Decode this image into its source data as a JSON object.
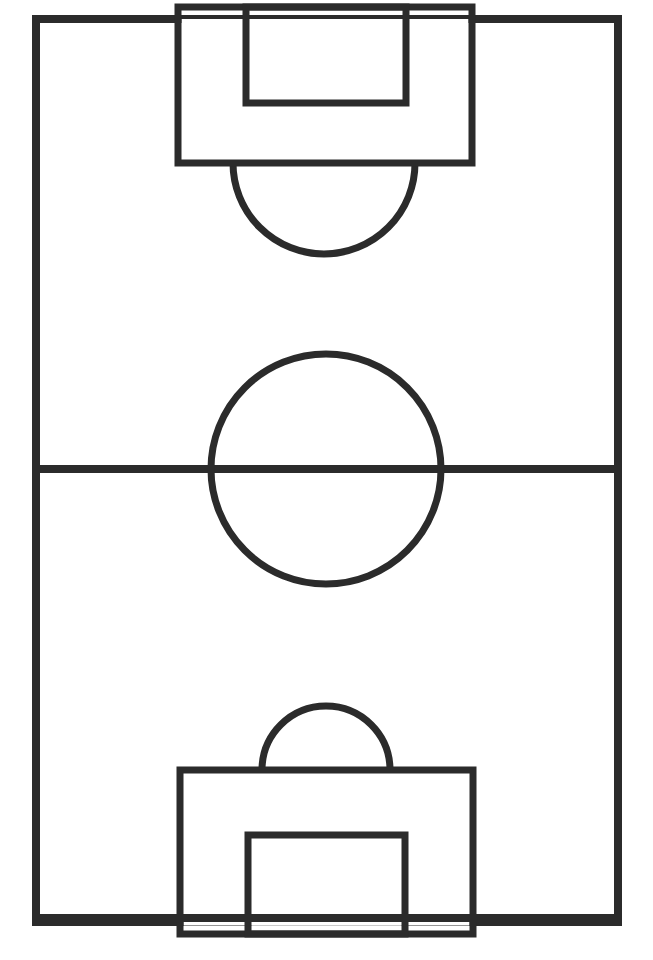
{
  "figure": {
    "orientation": "vertical",
    "canvas_width": 653,
    "canvas_height": 960,
    "background_color": "#fafafa"
  },
  "style": {
    "line_color": "#2b2b2b",
    "surface_color": "#ffffff",
    "boundary_stroke_width": 8,
    "halfway_stroke_width": 8,
    "box_stroke_width": 7,
    "arc_stroke_width": 7,
    "circle_stroke_width": 7
  },
  "chart_data": {
    "type": "diagram",
    "xlabel": "",
    "ylabel": "",
    "xlim": [
      0,
      653
    ],
    "ylim": [
      0,
      960
    ],
    "grid": false,
    "legend": "none",
    "elements": [
      {
        "name": "touchline-boundary",
        "shape": "rectangle",
        "x": 36,
        "y": 19,
        "width": 582,
        "height": 903,
        "stroke_width": 8
      },
      {
        "name": "halfway-line",
        "shape": "line",
        "x1": 36,
        "y1": 469,
        "x2": 618,
        "y2": 469,
        "stroke_width": 8
      },
      {
        "name": "center-circle",
        "shape": "circle",
        "cx": 326,
        "cy": 469,
        "r": 115,
        "stroke_width": 7
      },
      {
        "name": "top-penalty-area",
        "shape": "rectangle",
        "x": 178,
        "y": 19,
        "width": 294,
        "height": 144,
        "stroke_width": 7
      },
      {
        "name": "top-goal-area",
        "shape": "rectangle",
        "x": 246,
        "y": 19,
        "width": 160,
        "height": 84,
        "stroke_width": 7
      },
      {
        "name": "top-penalty-arc",
        "shape": "arc",
        "cx": 324,
        "cy": 163,
        "r": 91,
        "start_angle_deg": 0,
        "end_angle_deg": 180,
        "stroke_width": 7
      },
      {
        "name": "bottom-penalty-area",
        "shape": "rectangle",
        "x": 180,
        "y": 770,
        "width": 293,
        "height": 152,
        "stroke_width": 7
      },
      {
        "name": "bottom-goal-area",
        "shape": "rectangle",
        "x": 248,
        "y": 835,
        "width": 157,
        "height": 87,
        "stroke_width": 7
      },
      {
        "name": "bottom-penalty-arc",
        "shape": "arc",
        "cx": 326,
        "cy": 770,
        "r": 64,
        "start_angle_deg": 180,
        "end_angle_deg": 360,
        "stroke_width": 7
      }
    ]
  }
}
